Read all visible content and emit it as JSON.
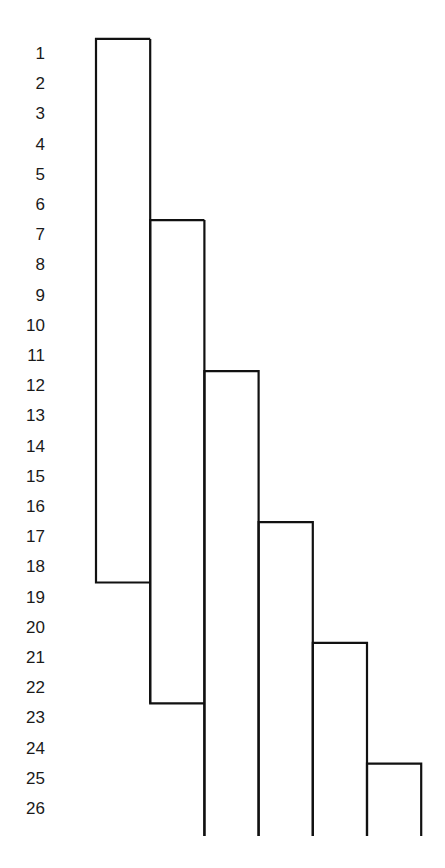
{
  "header": {
    "fragment": ""
  },
  "rows": [
    "1",
    "2",
    "3",
    "4",
    "5",
    "6",
    "7",
    "8",
    "9",
    "10",
    "11",
    "12",
    "13",
    "14",
    "15",
    "16",
    "17",
    "18",
    "19",
    "20",
    "21",
    "22",
    "23",
    "24",
    "25",
    "26"
  ],
  "brackets": [
    {
      "name": "bracket-1",
      "start_after_row": 0,
      "end_after_row": 18,
      "open_bottom": false
    },
    {
      "name": "bracket-2",
      "start_after_row": 6,
      "end_after_row": 22,
      "open_bottom": false
    },
    {
      "name": "bracket-3",
      "start_after_row": 11,
      "end_after_row": null,
      "open_bottom": true
    },
    {
      "name": "bracket-4",
      "start_after_row": 16,
      "end_after_row": null,
      "open_bottom": true
    },
    {
      "name": "bracket-5",
      "start_after_row": 20,
      "end_after_row": null,
      "open_bottom": true
    },
    {
      "name": "bracket-6",
      "start_after_row": 24,
      "end_after_row": null,
      "open_bottom": true
    }
  ],
  "colors": {
    "line": "#111111",
    "text": "#1a1a1a",
    "background": "#ffffff"
  }
}
